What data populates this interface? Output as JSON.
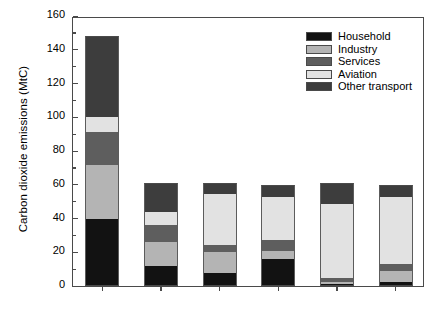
{
  "chart_data": {
    "type": "bar",
    "subtype": "stacked-bar",
    "title": "",
    "xlabel": "",
    "ylabel": "Carbon dioxide emissions (MtC)",
    "ylim": [
      0,
      160
    ],
    "ytick_labels": [
      "0",
      "20",
      "40",
      "60",
      "80",
      "100",
      "120",
      "140",
      "160"
    ],
    "ytick_values": [
      0,
      20,
      40,
      60,
      80,
      100,
      120,
      140,
      160
    ],
    "yminor_values": [
      10,
      30,
      50,
      70,
      90,
      110,
      130,
      150
    ],
    "grid": false,
    "legend_position": "top-right",
    "categories": [
      "Baseline",
      "Red",
      "Blue",
      "Turquoise",
      "Purple",
      "Pink"
    ],
    "series": [
      {
        "name": "Household",
        "color": "#121212",
        "values": [
          40.0,
          12.0,
          8.0,
          16.0,
          1.0,
          2.5
        ]
      },
      {
        "name": "Industry",
        "color": "#b4b4b4",
        "values": [
          31.5,
          14.0,
          12.0,
          4.5,
          1.5,
          6.5
        ]
      },
      {
        "name": "Services",
        "color": "#5e5e5e",
        "values": [
          19.5,
          10.0,
          4.5,
          7.0,
          2.0,
          4.0
        ]
      },
      {
        "name": "Aviation",
        "color": "#e2e2e2",
        "values": [
          9.0,
          8.0,
          30.0,
          25.5,
          44.0,
          39.5
        ]
      },
      {
        "name": "Other transport",
        "color": "#3d3d3d",
        "values": [
          48.0,
          17.0,
          6.5,
          7.0,
          12.5,
          7.5
        ]
      }
    ],
    "totals": [
      148.0,
      61.0,
      61.0,
      60.0,
      61.0,
      60.0
    ]
  },
  "legend": {
    "entries": [
      {
        "label": "Household"
      },
      {
        "label": "Industry"
      },
      {
        "label": "Services"
      },
      {
        "label": "Aviation"
      },
      {
        "label": "Other transport"
      }
    ]
  }
}
